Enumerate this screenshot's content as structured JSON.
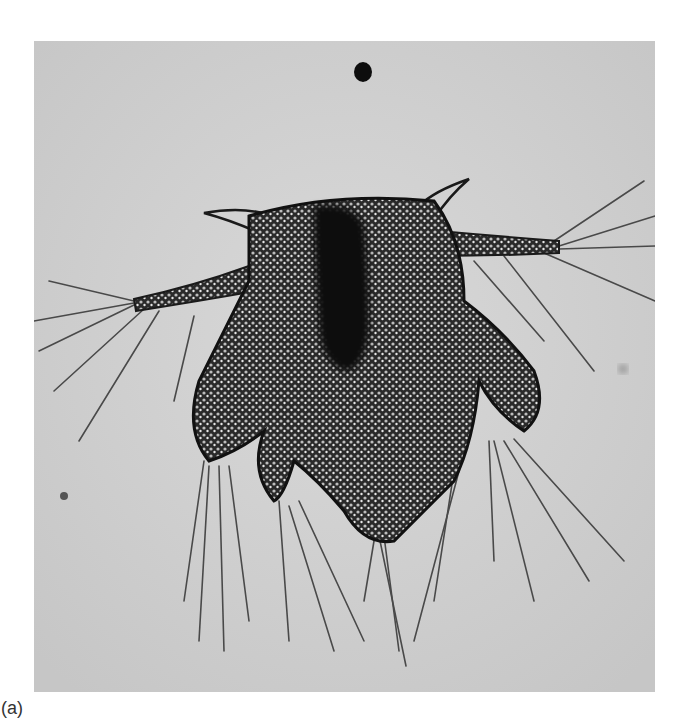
{
  "figure": {
    "panel_label": "(a)",
    "style": "grayscale-brightfield-micrograph",
    "colors": {
      "background_field": "#cfcfcf",
      "body_dark": "#1a1a1a",
      "setae": "#555555",
      "page": "#ffffff"
    }
  }
}
